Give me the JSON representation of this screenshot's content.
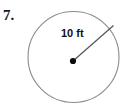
{
  "problem": {
    "number_label": "7.",
    "figure": {
      "shape_name": "circle",
      "radius_label": "10 ft",
      "radius_value": 10,
      "radius_units": "ft"
    }
  },
  "colors": {
    "background": "#ffffff",
    "circle_stroke": "#8c8c8c",
    "radius_stroke": "#595959",
    "center_dot": "#0d0d0d",
    "text": "#1a1a1a"
  },
  "geometry": {
    "circle": {
      "cx": 73.5,
      "cy": 57,
      "r": 45.5
    },
    "center_dot_radius": 3.1,
    "radius_endpoint": {
      "x": 113.5,
      "y": 25.5
    }
  }
}
